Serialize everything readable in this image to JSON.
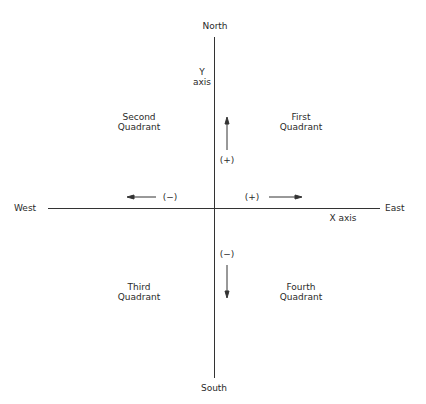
{
  "directions": {
    "north": "North",
    "south": "South",
    "east": "East",
    "west": "West"
  },
  "axes": {
    "y_label_line1": "Y",
    "y_label_line2": "axis",
    "x_label": "X axis"
  },
  "quadrants": {
    "first": {
      "line1": "First",
      "line2": "Quadrant"
    },
    "second": {
      "line1": "Second",
      "line2": "Quadrant"
    },
    "third": {
      "line1": "Third",
      "line2": "Quadrant"
    },
    "fourth": {
      "line1": "Fourth",
      "line2": "Quadrant"
    }
  },
  "signs": {
    "up": "(+)",
    "down": "(−)",
    "right": "(+)",
    "left": "(−)"
  },
  "colors": {
    "line": "#333333",
    "text": "#2a2a2a",
    "background": "#ffffff"
  }
}
